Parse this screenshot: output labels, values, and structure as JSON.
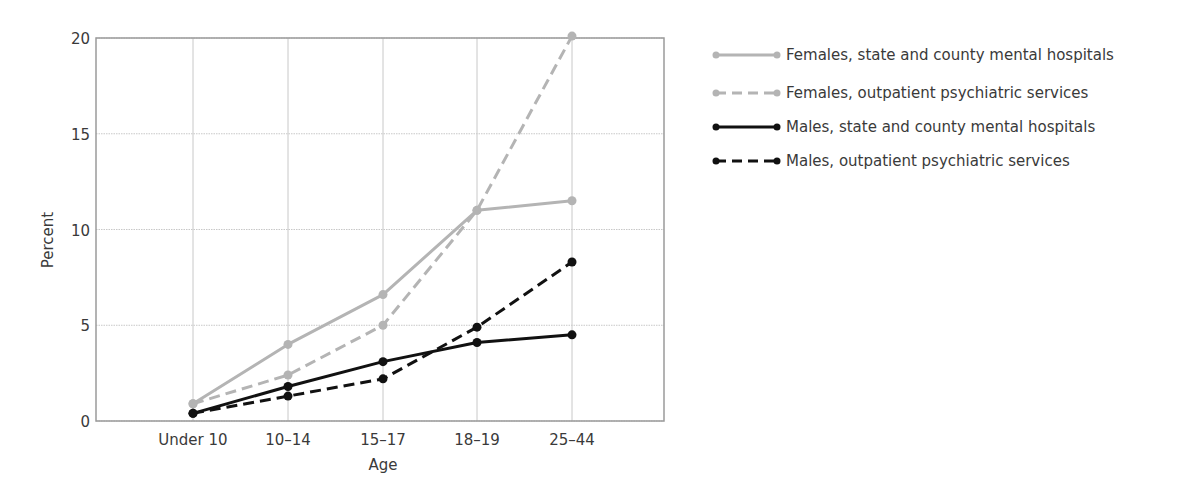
{
  "chart_data": {
    "type": "line",
    "title": "",
    "xlabel": "Age",
    "ylabel": "Percent",
    "categories": [
      "Under 10",
      "10–14",
      "15–17",
      "18–19",
      "25–44"
    ],
    "ylim": [
      0,
      20
    ],
    "yticks": [
      0,
      5,
      10,
      15,
      20
    ],
    "grid": true,
    "legend_position": "right",
    "series": [
      {
        "name": "Females, state and county mental hospitals",
        "color": "#b4b4b4",
        "dash": "solid",
        "values": [
          0.9,
          4.0,
          6.6,
          11.0,
          11.5
        ]
      },
      {
        "name": "Females, outpatient psychiatric services",
        "color": "#b4b4b4",
        "dash": "dashed",
        "values": [
          0.9,
          2.4,
          5.0,
          11.0,
          20.1
        ]
      },
      {
        "name": "Males, state and county mental hospitals",
        "color": "#111111",
        "dash": "solid",
        "values": [
          0.4,
          1.8,
          3.1,
          4.1,
          4.5
        ]
      },
      {
        "name": "Males, outpatient psychiatric services",
        "color": "#111111",
        "dash": "dashed",
        "values": [
          0.4,
          1.3,
          2.2,
          4.9,
          8.3
        ]
      }
    ]
  }
}
